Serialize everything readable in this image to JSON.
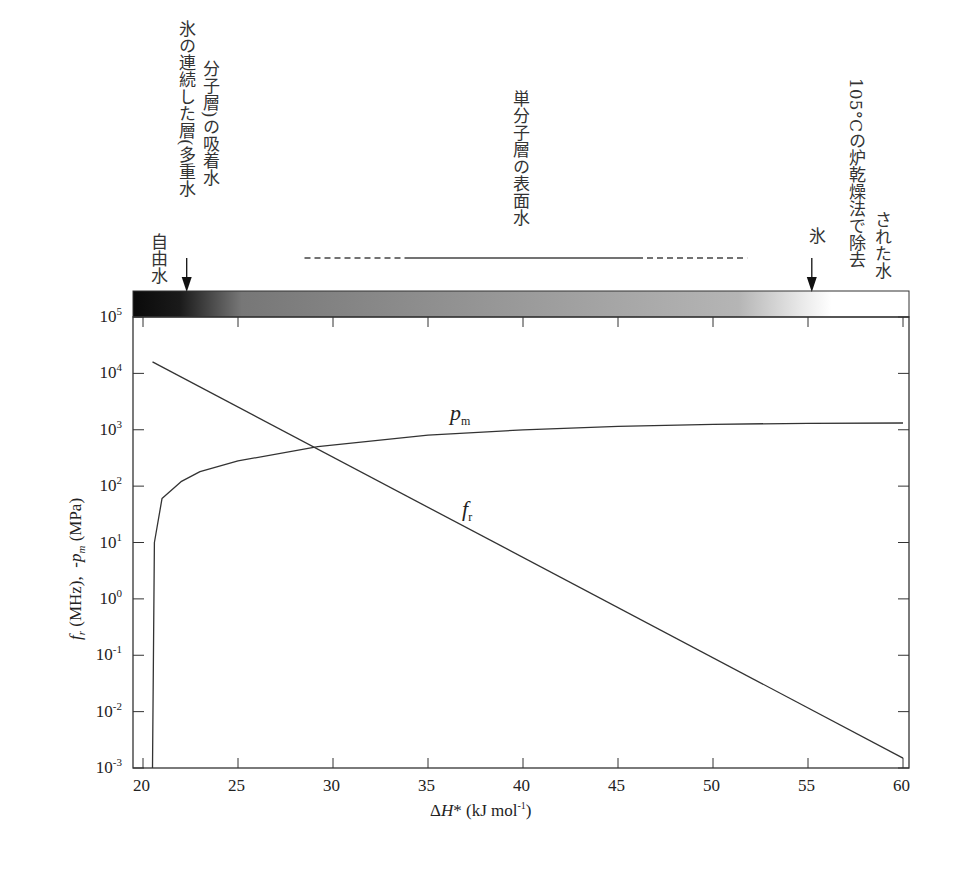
{
  "chart_data": {
    "type": "line",
    "title": "",
    "xlabel": "ΔH* (kJ mol⁻¹)",
    "ylabel": "f_r (MHz), -p_m (MPa)",
    "xlim": [
      19.5,
      60
    ],
    "ylim": [
      0.001,
      100000
    ],
    "yscale": "log",
    "grid": false,
    "x_ticks": [
      "20",
      "25",
      "30",
      "35",
      "40",
      "45",
      "50",
      "55",
      "60"
    ],
    "y_ticks": [
      "10^5",
      "10^4",
      "10^3",
      "10^2",
      "10^1",
      "10^0",
      "10^-1",
      "10^-2",
      "10^-3"
    ],
    "series": [
      {
        "name": "f_r",
        "x": [
          20.5,
          25,
          29.2,
          35,
          40,
          45,
          50,
          55,
          60
        ],
        "y": [
          16000,
          1900,
          500,
          40,
          4,
          0.4,
          0.04,
          0.0045,
          0.0015
        ]
      },
      {
        "name": "p_m",
        "x": [
          20.5,
          20.6,
          21,
          22,
          23,
          25,
          29.2,
          35,
          40,
          45,
          50,
          55,
          60
        ],
        "y": [
          0.001,
          10,
          60,
          120,
          180,
          280,
          500,
          800,
          1000,
          1150,
          1250,
          1300,
          1320
        ]
      }
    ],
    "curve_labels": [
      {
        "text": "p",
        "sub": "m",
        "x": 37.5,
        "y": 1700
      },
      {
        "text": "f",
        "sub": "r",
        "x": 37.5,
        "y": 50
      }
    ],
    "gradient_bar": {
      "description": "Water state band, dark (left) to light (right)",
      "from_x": 19.5,
      "to_x": 60,
      "dark_color": "#111111",
      "light_color": "#ffffff"
    },
    "annotations": [
      {
        "text": "自由水",
        "x": 20.5,
        "arrow": false
      },
      {
        "text": "氷の連続した層(多重水分子層)の吸着水",
        "line1": "氷の連続した層(多重水",
        "line2": "分子層)の吸着水",
        "x": 22.3,
        "arrow": true
      },
      {
        "text": "単分子層の表面水",
        "x": 37.5,
        "range_solid": [
          34,
          46
        ],
        "range_dashed": [
          28.5,
          51.8
        ],
        "arrow": false
      },
      {
        "text": "氷",
        "x": 55.2,
        "arrow": true
      },
      {
        "text": "105°Cの炉乾燥法で除去された水",
        "line1": "105°Cの炉乾燥法で除去",
        "line2": "された水",
        "x": 57.5,
        "arrow": false
      }
    ]
  }
}
